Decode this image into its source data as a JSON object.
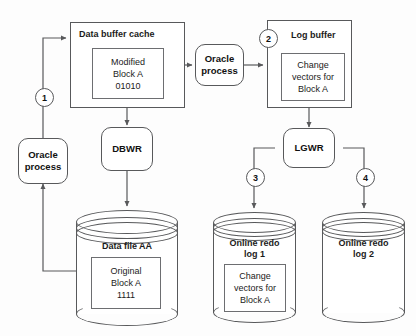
{
  "diagram": {
    "colors": {
      "stroke": "#58595b",
      "text": "#1b1b1b",
      "background": "#fdfdfd"
    },
    "steps": [
      {
        "id": "step-1",
        "label": "1"
      },
      {
        "id": "step-2",
        "label": "2"
      },
      {
        "id": "step-3",
        "label": "3"
      },
      {
        "id": "step-4",
        "label": "4"
      }
    ],
    "nodes": {
      "data_buffer_cache": {
        "title": "Data buffer cache",
        "block": {
          "line1": "Modified",
          "line2": "Block A",
          "line3": "01010"
        }
      },
      "oracle_process_top": {
        "line1": "Oracle",
        "line2": "process"
      },
      "log_buffer": {
        "title": "Log buffer",
        "block": {
          "line1": "Change",
          "line2": "vectors for",
          "line3": "Block A"
        }
      },
      "oracle_process_left": {
        "line1": "Oracle",
        "line2": "process"
      },
      "dbwr": {
        "label": "DBWR"
      },
      "lgwr": {
        "label": "LGWR"
      },
      "data_file": {
        "title": "Data file AA",
        "block": {
          "line1": "Original",
          "line2": "Block A",
          "line3": "1111"
        }
      },
      "redo_log_1": {
        "title_line1": "Online redo",
        "title_line2": "log 1",
        "block": {
          "line1": "Change",
          "line2": "vectors for",
          "line3": "Block A"
        }
      },
      "redo_log_2": {
        "title_line1": "Online redo",
        "title_line2": "log 2"
      }
    }
  }
}
